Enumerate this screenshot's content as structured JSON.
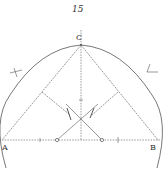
{
  "figure": {
    "plate_number": "15",
    "labels": {
      "apex": "C",
      "left_end": "A",
      "right_end": "B"
    },
    "colors": {
      "ink": "#555555",
      "paper": "#ffffff"
    },
    "elements": [
      "semicircle-arc-over-AB",
      "baseline-AB-dotted",
      "vertical-axis-dotted-through-C",
      "line-C-to-A",
      "line-C-to-B",
      "perpendicular-from-AC-with-arrow",
      "perpendicular-from-BC-with-arrow",
      "crossing-lines-from-base-points",
      "two-small-circles-on-baseline",
      "arc-marks-outside-circle"
    ]
  }
}
